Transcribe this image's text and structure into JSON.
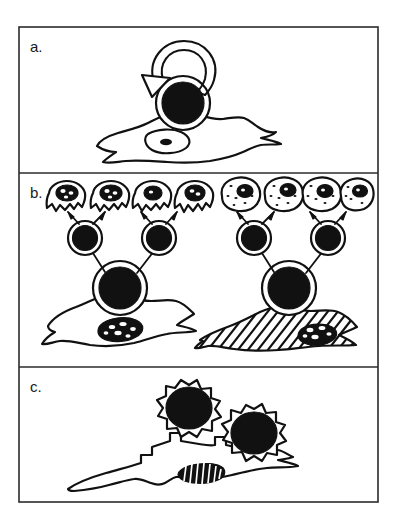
{
  "figure": {
    "background_color": "#ffffff",
    "ink_color": "#111111",
    "frame_color": "#2b2b2b",
    "panel_count": 3,
    "panels": [
      {
        "id": "a",
        "label": "a.",
        "caption_text": "",
        "description": "Spread macrophage with a large dark surface-bound particle and a curved recycling arrow above it",
        "elements": {
          "recycle_arrow": "circular-arrow",
          "bound_particle": "dark-round-particle",
          "host_cell": "spread-amoeboid-cell",
          "host_nucleus": "oval-nucleus-with-dark-dot"
        }
      },
      {
        "id": "b",
        "label": "b.",
        "caption_text": "",
        "description": "Two spread macrophages each releasing two dark round particles which in turn give rise to four smaller daughter cells; left group jagged outlines, right group smooth speckled outlines; right macrophage is hatched",
        "elements": {
          "left_macrophage": "unshaded-spread-cell",
          "right_macrophage": "hatched-spread-cell",
          "mid_particles_per_group": 2,
          "daughter_cells_per_group": 4,
          "left_daughter_style": "jagged-outline-dark-nucleus",
          "right_daughter_style": "smooth-outline-speckled"
        }
      },
      {
        "id": "c",
        "label": "c.",
        "caption_text": "",
        "description": "Elongated macrophage with two cog/spiky-coated dark particles partially engulfed at its surface",
        "elements": {
          "host_cell": "elongated-amoeboid-cell",
          "host_nucleus": "striped-oval-nucleus",
          "particle_count": 2,
          "particle_style": "cog-spiked-dark-particle"
        }
      }
    ]
  },
  "layout": {
    "frame": {
      "x": 19,
      "y": 27,
      "width": 359,
      "height": 475
    },
    "dividers_y": [
      173,
      367
    ],
    "label_positions": [
      {
        "id": "a",
        "x": 30,
        "y": 50
      },
      {
        "id": "b",
        "x": 30,
        "y": 196
      },
      {
        "id": "c",
        "x": 30,
        "y": 390
      }
    ]
  }
}
